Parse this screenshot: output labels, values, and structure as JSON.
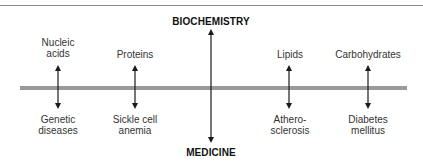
{
  "diagram": {
    "top_axis_label": "BIOCHEMISTRY",
    "bottom_axis_label": "MEDICINE",
    "colors": {
      "band": "#9a9a9a",
      "arrow": "#1a1a1a",
      "rule": "#8a8a8a"
    },
    "pairs": [
      {
        "biochemistry": {
          "line1": "Nucleic",
          "line2": "acids"
        },
        "medicine": {
          "line1": "Genetic",
          "line2": "diseases"
        }
      },
      {
        "biochemistry": {
          "line1": "Proteins",
          "line2": ""
        },
        "medicine": {
          "line1": "Sickle cell",
          "line2": "anemia"
        }
      },
      {
        "biochemistry": {
          "line1": "Lipids",
          "line2": ""
        },
        "medicine": {
          "line1": "Athero-",
          "line2": "sclerosis"
        }
      },
      {
        "biochemistry": {
          "line1": "Carbohydrates",
          "line2": ""
        },
        "medicine": {
          "line1": "Diabetes",
          "line2": "mellitus"
        }
      }
    ]
  }
}
